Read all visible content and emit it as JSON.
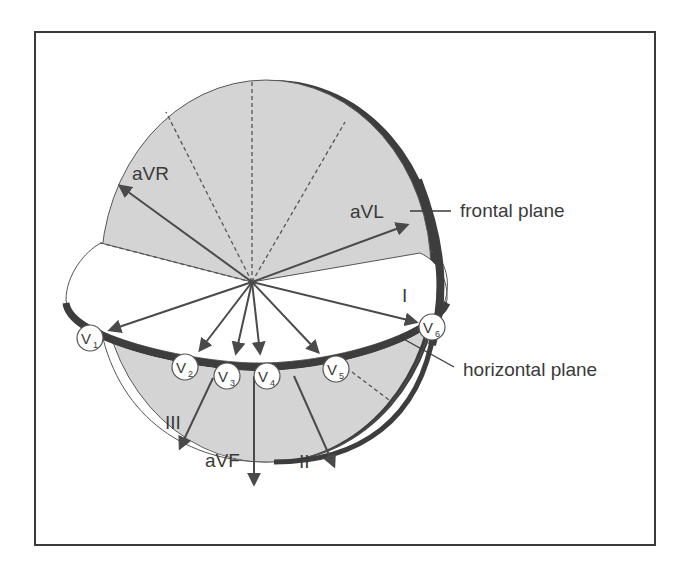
{
  "diagram": {
    "colors": {
      "frame": "#3a3a3a",
      "plane_fill": "#d4d4d4",
      "plane_rim": "#3d3d3d",
      "horizontal_fill": "#ffffff",
      "vector": "#4a4a4a",
      "text": "#3a3a3a"
    },
    "callouts": {
      "frontal_plane": "frontal plane",
      "horizontal_plane": "horizontal plane"
    },
    "frontal_leads": {
      "aVR": "aVR",
      "aVL": "aVL",
      "I": "I",
      "II": "II",
      "III": "III",
      "aVF": "aVF"
    },
    "precordial_leads": [
      {
        "letter": "V",
        "sub": "1"
      },
      {
        "letter": "V",
        "sub": "2"
      },
      {
        "letter": "V",
        "sub": "3"
      },
      {
        "letter": "V",
        "sub": "4"
      },
      {
        "letter": "V",
        "sub": "5"
      },
      {
        "letter": "V",
        "sub": "6"
      }
    ]
  }
}
